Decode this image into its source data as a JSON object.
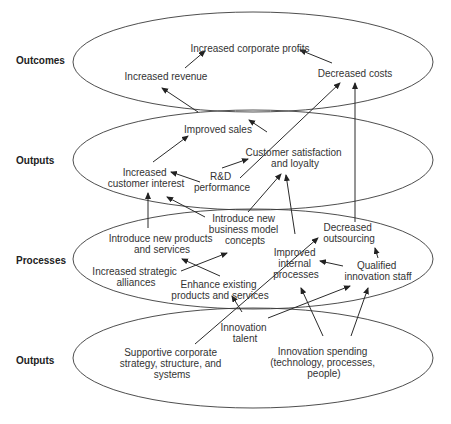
{
  "rows": [
    {
      "label": "Outcomes"
    },
    {
      "label": "Outputs"
    },
    {
      "label": "Processes"
    },
    {
      "label": "Outputs"
    }
  ],
  "nodes": {
    "profits": [
      "Increased corporate profits"
    ],
    "revenue": [
      "Increased revenue"
    ],
    "costs": [
      "Decreased costs"
    ],
    "sales": [
      "Improved sales"
    ],
    "satisfaction": [
      "Customer satisfaction",
      "and loyalty"
    ],
    "interest": [
      "Increased",
      "customer interest"
    ],
    "rnd": [
      "R&D",
      "performance"
    ],
    "bizmodel": [
      "Introduce new",
      "business model",
      "concepts"
    ],
    "newproducts": [
      "Introduce new products",
      "and services"
    ],
    "outsourcing": [
      "Decreased",
      "outsourcing"
    ],
    "improved_internal": [
      "Improved",
      "internal",
      "processes"
    ],
    "qualified": [
      "Qualified",
      "innovation staff"
    ],
    "alliances": [
      "Increased strategic",
      "alliances"
    ],
    "enhance": [
      "Enhance existing",
      "products and services"
    ],
    "talent": [
      "Innovation",
      "talent"
    ],
    "supportive": [
      "Supportive corporate",
      "strategy, structure, and",
      "systems"
    ],
    "spending": [
      "Innovation spending",
      "(technology, processes,",
      "people)"
    ]
  }
}
